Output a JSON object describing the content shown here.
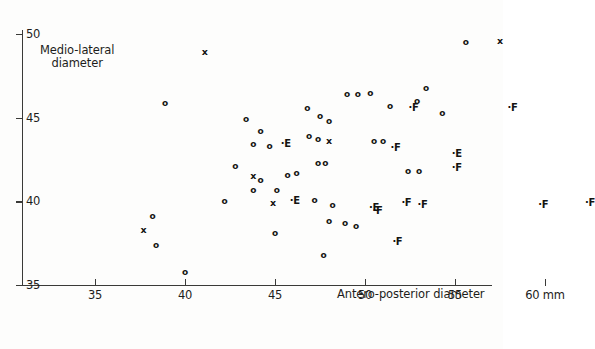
{
  "chart_data": {
    "type": "scatter",
    "title": "",
    "xlabel": "Antero-posterior diameter",
    "ylabel": "Medio-lateral diameter",
    "x_unit": "mm",
    "xlim": [
      35,
      60
    ],
    "ylim": [
      35,
      50
    ],
    "xticks": [
      35,
      40,
      45,
      50,
      55,
      60
    ],
    "xtick_labels": [
      "35",
      "40",
      "45",
      "50",
      "55",
      "60 mm"
    ],
    "yticks": [
      35,
      40,
      45,
      50
    ],
    "ytick_labels": [
      "35",
      "40",
      "45",
      "50"
    ],
    "grid": false,
    "legend": "none",
    "marker_types": [
      "o",
      "x",
      "E",
      "F"
    ],
    "points": [
      {
        "m": "o",
        "x": 38.9,
        "y": 45.9
      },
      {
        "m": "x",
        "x": 41.1,
        "y": 48.9
      },
      {
        "m": "o",
        "x": 43.4,
        "y": 44.9
      },
      {
        "m": "o",
        "x": 44.2,
        "y": 44.2
      },
      {
        "m": "o",
        "x": 43.8,
        "y": 43.4
      },
      {
        "m": "o",
        "x": 44.7,
        "y": 43.3
      },
      {
        "m": "o",
        "x": 42.8,
        "y": 42.1
      },
      {
        "m": "x",
        "x": 43.8,
        "y": 41.5
      },
      {
        "m": "o",
        "x": 44.2,
        "y": 41.3
      },
      {
        "m": "o",
        "x": 43.8,
        "y": 40.7
      },
      {
        "m": "o",
        "x": 45.1,
        "y": 40.7
      },
      {
        "m": "o",
        "x": 45.7,
        "y": 41.6
      },
      {
        "m": "o",
        "x": 46.2,
        "y": 41.7
      },
      {
        "m": "x",
        "x": 44.9,
        "y": 39.9
      },
      {
        "m": "o",
        "x": 47.2,
        "y": 40.1
      },
      {
        "m": "o",
        "x": 42.2,
        "y": 40.0
      },
      {
        "m": "o",
        "x": 38.2,
        "y": 39.1
      },
      {
        "m": "x",
        "x": 37.7,
        "y": 38.3
      },
      {
        "m": "o",
        "x": 38.4,
        "y": 37.4
      },
      {
        "m": "o",
        "x": 40.0,
        "y": 35.8
      },
      {
        "m": "o",
        "x": 45.0,
        "y": 38.1
      },
      {
        "m": "o",
        "x": 47.7,
        "y": 36.8
      },
      {
        "m": "o",
        "x": 46.8,
        "y": 45.6
      },
      {
        "m": "o",
        "x": 47.5,
        "y": 45.1
      },
      {
        "m": "o",
        "x": 48.0,
        "y": 44.8
      },
      {
        "m": "o",
        "x": 46.9,
        "y": 43.9
      },
      {
        "m": "o",
        "x": 47.4,
        "y": 43.7
      },
      {
        "m": "x",
        "x": 48.0,
        "y": 43.6
      },
      {
        "m": "o",
        "x": 49.0,
        "y": 46.4
      },
      {
        "m": "o",
        "x": 49.6,
        "y": 46.4
      },
      {
        "m": "o",
        "x": 50.3,
        "y": 46.5
      },
      {
        "m": "o",
        "x": 51.4,
        "y": 45.7
      },
      {
        "m": "o",
        "x": 50.5,
        "y": 43.6
      },
      {
        "m": "o",
        "x": 51.0,
        "y": 43.6
      },
      {
        "m": "o",
        "x": 47.4,
        "y": 42.3
      },
      {
        "m": "o",
        "x": 47.8,
        "y": 42.3
      },
      {
        "m": "o",
        "x": 48.2,
        "y": 39.8
      },
      {
        "m": "o",
        "x": 48.0,
        "y": 38.8
      },
      {
        "m": "o",
        "x": 48.9,
        "y": 38.7
      },
      {
        "m": "o",
        "x": 49.5,
        "y": 38.5
      },
      {
        "m": "o",
        "x": 52.4,
        "y": 41.8
      },
      {
        "m": "o",
        "x": 53.0,
        "y": 41.8
      },
      {
        "m": "o",
        "x": 53.4,
        "y": 46.8
      },
      {
        "m": "o",
        "x": 52.9,
        "y": 46.0
      },
      {
        "m": "o",
        "x": 54.3,
        "y": 45.3
      },
      {
        "m": "o",
        "x": 55.6,
        "y": 49.5
      },
      {
        "m": "x",
        "x": 57.5,
        "y": 49.6
      },
      {
        "m": "E",
        "x": 45.6,
        "y": 43.4
      },
      {
        "m": "E",
        "x": 46.1,
        "y": 40.0
      },
      {
        "m": "E",
        "x": 50.5,
        "y": 39.6
      },
      {
        "m": "E",
        "x": 55.1,
        "y": 42.8
      },
      {
        "m": "F",
        "x": 50.7,
        "y": 39.4
      },
      {
        "m": "F",
        "x": 51.7,
        "y": 43.2
      },
      {
        "m": "F",
        "x": 52.3,
        "y": 39.9
      },
      {
        "m": "F",
        "x": 53.2,
        "y": 39.8
      },
      {
        "m": "F",
        "x": 51.8,
        "y": 37.6
      },
      {
        "m": "F",
        "x": 55.1,
        "y": 42.0
      },
      {
        "m": "F",
        "x": 52.7,
        "y": 45.6
      },
      {
        "m": "F",
        "x": 58.2,
        "y": 45.6
      },
      {
        "m": "F",
        "x": 59.9,
        "y": 39.8
      },
      {
        "m": "F",
        "x": 62.5,
        "y": 39.9
      }
    ]
  }
}
